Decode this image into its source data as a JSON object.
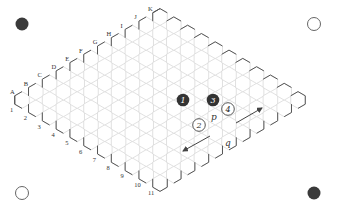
{
  "board": {
    "size": 11,
    "row_letters": [
      "A",
      "B",
      "C",
      "D",
      "E",
      "F",
      "G",
      "H",
      "I",
      "J",
      "K"
    ],
    "col_numbers": [
      "1",
      "2",
      "3",
      "4",
      "5",
      "6",
      "7",
      "8",
      "9",
      "10",
      "11"
    ],
    "hex_radius": 8.4,
    "origin": {
      "x": 22,
      "y": 100
    },
    "step_letter": {
      "dx": 13.8,
      "dy": -8.3
    },
    "step_number": {
      "dx": 13.8,
      "dy": 8.3
    }
  },
  "stones": [
    {
      "id": "1",
      "color": "black",
      "x": 183,
      "y": 100,
      "label": "1"
    },
    {
      "id": "2",
      "color": "white",
      "x": 199,
      "y": 125,
      "label": "2"
    },
    {
      "id": "3",
      "color": "black",
      "x": 213,
      "y": 100,
      "label": "3"
    },
    {
      "id": "4",
      "color": "white",
      "x": 228,
      "y": 109,
      "label": "4"
    }
  ],
  "labels": [
    {
      "text": "p",
      "x": 214,
      "y": 120
    },
    {
      "text": "q",
      "x": 228,
      "y": 146
    }
  ],
  "arrows": [
    {
      "x1": 236,
      "y1": 123,
      "x2": 262,
      "y2": 108
    },
    {
      "x1": 210,
      "y1": 136,
      "x2": 183,
      "y2": 151
    }
  ],
  "corners": [
    {
      "pos": "top-left",
      "color": "black",
      "x": 22,
      "y": 24
    },
    {
      "pos": "top-right",
      "color": "white",
      "x": 314,
      "y": 24
    },
    {
      "pos": "bottom-left",
      "color": "white",
      "x": 22,
      "y": 193
    },
    {
      "pos": "bottom-right",
      "color": "black",
      "x": 314,
      "y": 193
    }
  ]
}
